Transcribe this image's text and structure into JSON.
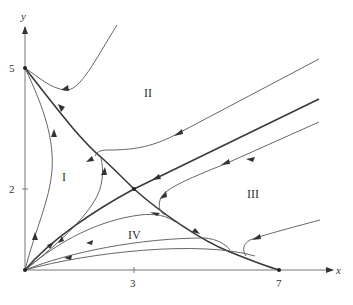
{
  "diagram": {
    "type": "phase-plane",
    "axes": {
      "x_label": "x",
      "y_label": "y",
      "x_ticks": [
        {
          "value": 3,
          "label": "3"
        },
        {
          "value": 7,
          "label": "7"
        }
      ],
      "y_ticks": [
        {
          "value": 2,
          "label": "2"
        },
        {
          "value": 5,
          "label": "5"
        }
      ]
    },
    "regions": [
      {
        "id": "I",
        "label": "I"
      },
      {
        "id": "II",
        "label": "II"
      },
      {
        "id": "III",
        "label": "III"
      },
      {
        "id": "IV",
        "label": "IV"
      }
    ],
    "equilibria": [
      {
        "name": "origin",
        "x": 0,
        "y": 0
      },
      {
        "name": "y-intercept",
        "x": 0,
        "y": 5
      },
      {
        "name": "saddle",
        "x": 3,
        "y": 2
      },
      {
        "name": "x-intercept",
        "x": 7,
        "y": 0
      }
    ],
    "colors": {
      "trajectory": "#555555",
      "separatrix": "#3a3a3a",
      "axis": "#777777",
      "text": "#333333"
    }
  }
}
